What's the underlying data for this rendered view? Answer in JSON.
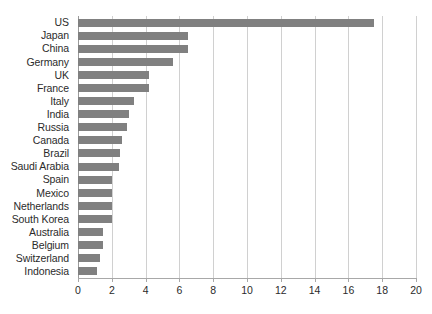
{
  "chart_data": {
    "type": "bar",
    "orientation": "horizontal",
    "title": "",
    "subtitle": "",
    "xlabel": "",
    "ylabel": "",
    "xlim": [
      0,
      20
    ],
    "ylim": null,
    "xticks": [
      0,
      2,
      4,
      6,
      8,
      10,
      12,
      14,
      16,
      18,
      20
    ],
    "grid": "vertical",
    "legend": null,
    "categories": [
      "US",
      "Japan",
      "China",
      "Germany",
      "UK",
      "France",
      "Italy",
      "India",
      "Russia",
      "Canada",
      "Brazil",
      "Saudi Arabia",
      "Spain",
      "Mexico",
      "Netherlands",
      "South Korea",
      "Australia",
      "Belgium",
      "Switzerland",
      "Indonesia"
    ],
    "values": [
      17.5,
      6.5,
      6.5,
      5.6,
      4.2,
      4.2,
      3.3,
      3.0,
      2.9,
      2.6,
      2.5,
      2.4,
      2.0,
      2.0,
      2.0,
      2.0,
      1.5,
      1.5,
      1.3,
      1.1
    ],
    "series": [
      {
        "name": "",
        "values": [
          17.5,
          6.5,
          6.5,
          5.6,
          4.2,
          4.2,
          3.3,
          3.0,
          2.9,
          2.6,
          2.5,
          2.4,
          2.0,
          2.0,
          2.0,
          2.0,
          1.5,
          1.5,
          1.3,
          1.1
        ]
      }
    ]
  },
  "style": {
    "bar_color": "#808080",
    "gridline_color": "#d0d0d0",
    "axis_color": "#a8a8a8",
    "text_color": "#2b2b2b",
    "background": "#ffffff"
  }
}
